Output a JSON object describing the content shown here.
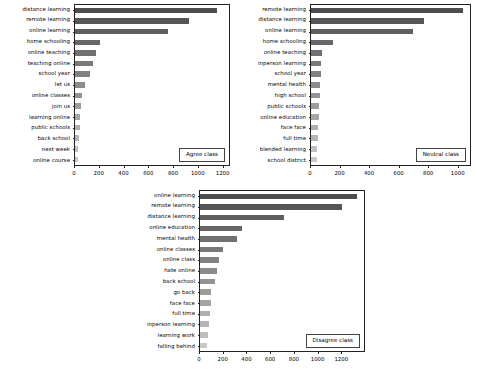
{
  "figure": {
    "background": "#ffffff",
    "bar_color_dark": "#4d4d4d",
    "bar_color_light": "#c8c8c8",
    "axis_color": "#222222"
  },
  "chart_data": [
    {
      "type": "bar",
      "orientation": "horizontal",
      "title": "",
      "legend_label": "Agree class",
      "legend_position": "lower right",
      "xlabel": "",
      "ylabel": "",
      "grid": false,
      "xlim": [
        0,
        1260
      ],
      "xticks": [
        0,
        200,
        400,
        600,
        800,
        1000,
        1200
      ],
      "xtick_labels": [
        "0",
        "200",
        "400",
        "600",
        "800",
        "1000",
        "1200"
      ],
      "categories": [
        "distance learning",
        "remote learning",
        "online learning",
        "home schooling",
        "online teaching",
        "teaching online",
        "school year",
        "let us",
        "online classes",
        "join us",
        "learning online",
        "public schools",
        "back school",
        "next week",
        "online course"
      ],
      "values": [
        1165,
        930,
        760,
        205,
        175,
        150,
        125,
        85,
        58,
        50,
        42,
        38,
        35,
        28,
        22
      ]
    },
    {
      "type": "bar",
      "orientation": "horizontal",
      "title": "",
      "legend_label": "Neutral class",
      "legend_position": "lower right",
      "xlabel": "",
      "ylabel": "",
      "grid": false,
      "xlim": [
        0,
        1090
      ],
      "xticks": [
        0,
        200,
        400,
        600,
        800,
        1000
      ],
      "xtick_labels": [
        "0",
        "200",
        "400",
        "600",
        "800",
        "1000"
      ],
      "categories": [
        "remote learning",
        "distance learning",
        "online learning",
        "home schooling",
        "online teaching",
        "inperson learning",
        "school year",
        "mental health",
        "high school",
        "public schools",
        "online education",
        "face face",
        "full time",
        "blended learning",
        "school district"
      ],
      "values": [
        1040,
        775,
        700,
        152,
        72,
        70,
        66,
        62,
        60,
        56,
        54,
        50,
        48,
        44,
        42
      ]
    },
    {
      "type": "bar",
      "orientation": "horizontal",
      "title": "",
      "legend_label": "Disagree class",
      "legend_position": "lower right",
      "xlabel": "",
      "ylabel": "",
      "grid": false,
      "xlim": [
        0,
        1400
      ],
      "xticks": [
        0,
        200,
        400,
        600,
        800,
        1000,
        1200
      ],
      "xtick_labels": [
        "0",
        "200",
        "400",
        "600",
        "800",
        "1000",
        "1200"
      ],
      "categories": [
        "online learning",
        "remote learning",
        "distance learning",
        "online education",
        "mental health",
        "online classes",
        "online class",
        "hate online",
        "back school",
        "go back",
        "face face",
        "full time",
        "inperson learning",
        "learning work",
        "falling behind"
      ],
      "values": [
        1340,
        1215,
        715,
        355,
        320,
        200,
        165,
        145,
        130,
        95,
        92,
        88,
        78,
        72,
        62
      ]
    }
  ]
}
